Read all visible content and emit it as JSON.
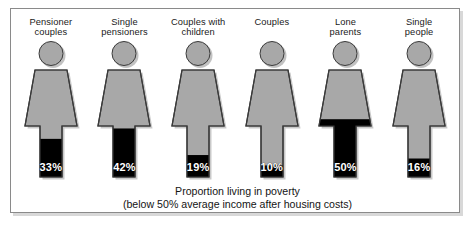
{
  "chart_data": {
    "type": "bar",
    "title": "Proportion living in poverty",
    "subtitle": "(below 50% average income after housing costs)",
    "xlabel": "",
    "ylabel": "Proportion living in poverty (%)",
    "ylim": [
      0,
      100
    ],
    "grid": false,
    "legend": "none",
    "categories": [
      "Pensioner couples",
      "Single pensioners",
      "Couples with children",
      "Couples",
      "Lone parents",
      "Single people"
    ],
    "values": [
      33,
      42,
      19,
      10,
      50,
      16
    ],
    "value_labels": [
      "33%",
      "42%",
      "19%",
      "10%",
      "50%",
      "16%"
    ],
    "note": "Pictogram bar chart: each human figure is filled black from the bottom in proportion to the percentage."
  },
  "frame": {
    "border_color": "#8a8a8a",
    "shadow_color": "#d8d8d8",
    "background": "#ffffff"
  },
  "style": {
    "figure_fill": "#a8a8a8",
    "figure_outline": "#3a3a3a",
    "value_fill": "#000000",
    "value_text_color": "#ffffff",
    "text_color": "#1a1a1a"
  },
  "figures": [
    {
      "label": "Pensioner\ncouples",
      "value": 33,
      "value_label": "33%",
      "fill_ratio": 0.33
    },
    {
      "label": "Single\npensioners",
      "value": 42,
      "value_label": "42%",
      "fill_ratio": 0.42
    },
    {
      "label": "Couples with\nchildren",
      "value": 19,
      "value_label": "19%",
      "fill_ratio": 0.19
    },
    {
      "label": "Couples",
      "value": 10,
      "value_label": "10%",
      "fill_ratio": 0.1
    },
    {
      "label": "Lone\nparents",
      "value": 50,
      "value_label": "50%",
      "fill_ratio": 0.5
    },
    {
      "label": "Single\npeople",
      "value": 16,
      "value_label": "16%",
      "fill_ratio": 0.16
    }
  ],
  "caption": {
    "line1": "Proportion living in poverty",
    "line2": "(below 50% average income after housing costs)"
  }
}
